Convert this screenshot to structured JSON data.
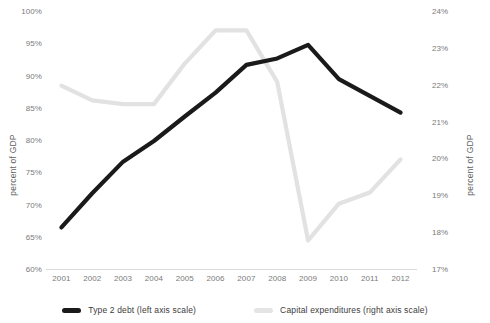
{
  "chart_data": {
    "type": "line",
    "title": "",
    "xlabel": "",
    "ylabel": "percent of GDP",
    "y2label": "percent of GDP",
    "grid": false,
    "legend_position": "bottom",
    "x": [
      "2001",
      "2002",
      "2003",
      "2004",
      "2005",
      "2006",
      "2007",
      "2008",
      "2009",
      "2010",
      "2011",
      "2012"
    ],
    "categories": [
      "2001",
      "2002",
      "2003",
      "2004",
      "2005",
      "2006",
      "2007",
      "2008",
      "2009",
      "2010",
      "2011",
      "2012"
    ],
    "left_axis": {
      "label": "percent of GDP",
      "ylim": [
        60,
        100
      ],
      "ticks": [
        "60%",
        "65%",
        "70%",
        "75%",
        "80%",
        "85%",
        "90%",
        "95%",
        "100%"
      ],
      "tick_values": [
        60,
        65,
        70,
        75,
        80,
        85,
        90,
        95,
        100
      ]
    },
    "right_axis": {
      "label": "percent of GDP",
      "ylim": [
        17,
        24
      ],
      "ticks": [
        "17%",
        "18%",
        "19%",
        "20%",
        "21%",
        "22%",
        "23%",
        "24%"
      ],
      "tick_values": [
        17,
        18,
        19,
        20,
        21,
        22,
        23,
        24
      ]
    },
    "series": [
      {
        "name": "Type 2 debt (left axis scale)",
        "axis": "left",
        "color": "#1a1a1a",
        "values": [
          66.6,
          71.9,
          76.8,
          80.0,
          83.8,
          87.5,
          91.8,
          92.8,
          94.9,
          89.6,
          87.0,
          84.4
        ]
      },
      {
        "name": "Capital expenditures (right axis scale)",
        "axis": "right",
        "color": "#e2e2e2",
        "values": [
          22.0,
          21.6,
          21.5,
          21.5,
          22.6,
          23.5,
          23.5,
          22.1,
          17.8,
          18.8,
          19.1,
          20.0
        ]
      }
    ]
  },
  "legend": {
    "items": [
      {
        "label": "Type 2 debt (left axis scale)",
        "color": "#1a1a1a"
      },
      {
        "label": "Capital expenditures (right axis scale)",
        "color": "#e4e4e4"
      }
    ]
  }
}
